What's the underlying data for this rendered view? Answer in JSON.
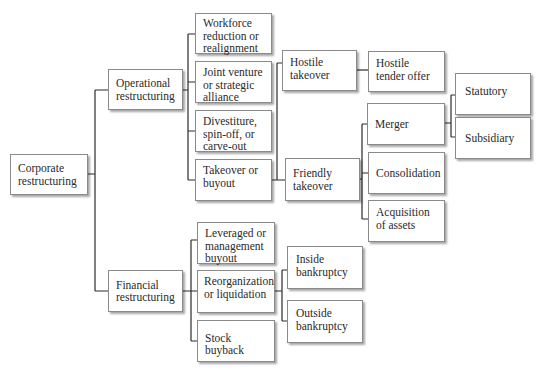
{
  "diagram": {
    "type": "hierarchy-tree",
    "root": "Corporate restructuring",
    "nodes": {
      "corporate": "Corporate restructuring",
      "operational": "Operational restructuring",
      "financial": "Financial restructuring",
      "workforce": "Workforce reduction or realignment",
      "joint_venture": "Joint venture or strategic alliance",
      "divestiture": "Divestiture, spin-off, or carve-out",
      "takeover": "Takeover or buyout",
      "leveraged": "Leveraged or management buyout",
      "reorganization": "Reorganization or liquidation",
      "stock_buyback": "Stock buyback",
      "hostile_takeover": "Hostile takeover",
      "hostile_tender": "Hostile tender offer",
      "friendly_takeover": "Friendly takeover",
      "merger": "Merger",
      "consolidation": "Consolidation",
      "acquisition": "Acquisition of assets",
      "statutory": "Statutory",
      "subsidiary": "Subsidiary",
      "inside_bankruptcy": "Inside bankruptcy",
      "outside_bankruptcy": "Outside bankruptcy"
    },
    "edges": [
      [
        "corporate",
        "operational"
      ],
      [
        "corporate",
        "financial"
      ],
      [
        "operational",
        "workforce"
      ],
      [
        "operational",
        "joint_venture"
      ],
      [
        "operational",
        "divestiture"
      ],
      [
        "operational",
        "takeover"
      ],
      [
        "takeover",
        "hostile_takeover"
      ],
      [
        "takeover",
        "friendly_takeover"
      ],
      [
        "hostile_takeover",
        "hostile_tender"
      ],
      [
        "friendly_takeover",
        "merger"
      ],
      [
        "friendly_takeover",
        "consolidation"
      ],
      [
        "friendly_takeover",
        "acquisition"
      ],
      [
        "merger",
        "statutory"
      ],
      [
        "merger",
        "subsidiary"
      ],
      [
        "financial",
        "leveraged"
      ],
      [
        "financial",
        "reorganization"
      ],
      [
        "financial",
        "stock_buyback"
      ],
      [
        "reorganization",
        "inside_bankruptcy"
      ],
      [
        "reorganization",
        "outside_bankruptcy"
      ]
    ]
  }
}
